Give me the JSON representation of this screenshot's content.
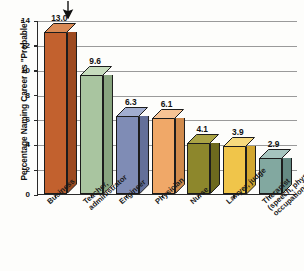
{
  "chart_data": {
    "type": "bar",
    "title": "",
    "xlabel": "",
    "ylabel": "Percentage Naming Career as \"Probable\"",
    "ylim": [
      0,
      14
    ],
    "yticks": [
      "0",
      "2",
      "4",
      "6",
      "8",
      "10",
      "12",
      "14"
    ],
    "grid": true,
    "legend": "none",
    "categories": [
      "Business",
      "Teacher, administrator",
      "Engineer",
      "Physician",
      "Nurse",
      "Lawyer, judge",
      "Therapist (speech, physical, occupational)"
    ],
    "values": [
      13.0,
      9.6,
      6.3,
      6.1,
      4.1,
      3.9,
      2.9
    ],
    "value_labels": [
      "13.0",
      "9.6",
      "6.3",
      "6.1",
      "4.1",
      "3.9",
      "2.9"
    ],
    "bar_colors": [
      "#c2612e",
      "#a9c5a0",
      "#7f8cb5",
      "#f0a868",
      "#8d872c",
      "#f0c54a",
      "#82a8a0"
    ],
    "bar_top_colors": [
      "#d98a55",
      "#c6dcbd",
      "#a1adcf",
      "#f7c394",
      "#aaa345",
      "#f7da7e",
      "#a5c4be"
    ],
    "bar_side_colors": [
      "#9d4a20",
      "#88a57f",
      "#636f99",
      "#d08a4c",
      "#6d6a1e",
      "#d2a62f",
      "#658a83"
    ],
    "annotations": [
      {
        "type": "arrow",
        "direction": "down",
        "target_category": "Business"
      }
    ]
  },
  "y_axis": {
    "title": "Percentage Naming Career as \"Probable\""
  },
  "header": {
    "clipped_title": ""
  }
}
